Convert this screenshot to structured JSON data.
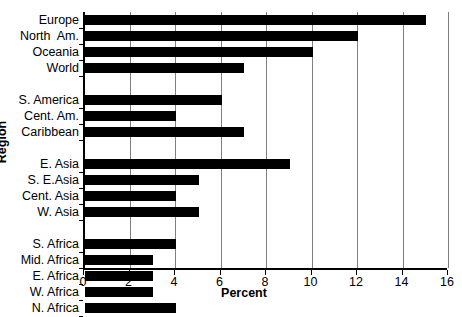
{
  "chart_data": {
    "type": "bar",
    "orientation": "horizontal",
    "title": "",
    "xlabel": "Percent",
    "ylabel": "Region",
    "xlim": [
      0,
      16
    ],
    "xticks": [
      0,
      2,
      4,
      6,
      8,
      10,
      12,
      14,
      16
    ],
    "grid": "vertical",
    "legend": null,
    "bar_color": "#000000",
    "categories": [
      "Europe",
      "North  Am.",
      "Oceania",
      "World",
      "S. America",
      "Cent. Am.",
      "Caribbean",
      "E. Asia",
      "S. E.Asia",
      "Cent. Asia",
      "W. Asia",
      "S. Africa",
      "Mid. Africa",
      "E. Africa",
      "W. Africa",
      "N. Africa"
    ],
    "values": [
      15,
      12,
      10,
      7,
      6,
      4,
      7,
      9,
      5,
      4,
      5,
      4,
      3,
      3,
      3,
      4
    ],
    "group_breaks_after": [
      "World",
      "Caribbean",
      "W. Asia"
    ]
  },
  "rows": [
    {
      "label": "Europe",
      "value": 15,
      "spacer_after": false
    },
    {
      "label": "North  Am.",
      "value": 12,
      "spacer_after": false
    },
    {
      "label": "Oceania",
      "value": 10,
      "spacer_after": false
    },
    {
      "label": "World",
      "value": 7,
      "spacer_after": true
    },
    {
      "label": "S. America",
      "value": 6,
      "spacer_after": false
    },
    {
      "label": "Cent. Am.",
      "value": 4,
      "spacer_after": false
    },
    {
      "label": "Caribbean",
      "value": 7,
      "spacer_after": true
    },
    {
      "label": "E. Asia",
      "value": 9,
      "spacer_after": false
    },
    {
      "label": "S. E.Asia",
      "value": 5,
      "spacer_after": false
    },
    {
      "label": "Cent. Asia",
      "value": 4,
      "spacer_after": false
    },
    {
      "label": "W. Asia",
      "value": 5,
      "spacer_after": true
    },
    {
      "label": "S. Africa",
      "value": 4,
      "spacer_after": false
    },
    {
      "label": "Mid. Africa",
      "value": 3,
      "spacer_after": false
    },
    {
      "label": "E. Africa",
      "value": 3,
      "spacer_after": false
    },
    {
      "label": "W. Africa",
      "value": 3,
      "spacer_after": false
    },
    {
      "label": "N. Africa",
      "value": 4,
      "spacer_after": false
    }
  ],
  "axes": {
    "x_title": "Percent",
    "y_title": "Region",
    "x_tick_labels": [
      "0",
      "2",
      "4",
      "6",
      "8",
      "10",
      "12",
      "14",
      "16"
    ]
  },
  "colors": {
    "bar": "#000000",
    "grid": "#808080",
    "axis": "#000000",
    "background": "#ffffff"
  }
}
